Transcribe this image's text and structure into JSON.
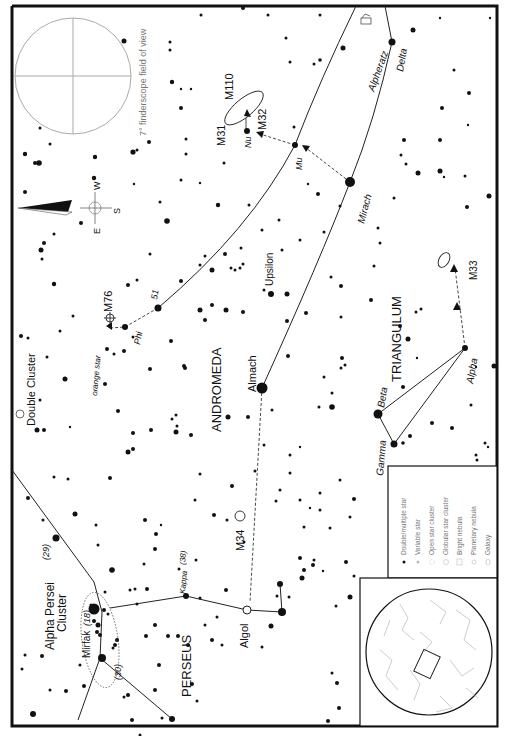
{
  "chart": {
    "orientation": "rotated 90 degrees (text reads bottom-to-top)",
    "finderscope_caption": "7° finderscope field of view",
    "compass": {
      "east": "E",
      "west": "W",
      "south": "S"
    },
    "constellations": [
      "ANDROMEDA",
      "PERSEUS",
      "TRIANGULUM"
    ],
    "objects": {
      "m31": "M31",
      "m32": "M32",
      "m110": "M110",
      "m33": "M33",
      "m34": "M34",
      "m76": "M76",
      "double_cluster": "Double Cluster",
      "alpha_persei_cluster_1": "Alpha Persei",
      "alpha_persei_cluster_2": "Cluster"
    },
    "stars": {
      "alpheratz": "Alpheratz",
      "delta": "Delta",
      "mirach": "Mirach",
      "mu": "Mu",
      "nu": "Nu",
      "upsilon": "Upsilon",
      "almach": "Almach",
      "phi": "Phi",
      "n51": "51",
      "orange_star": "orange star",
      "beta": "Beta",
      "gamma": "Gamma",
      "alpha": "Alpha",
      "algol": "Algol",
      "kappa": "Kappa",
      "kappa_num": "(38)",
      "mirfak": "Mirfak",
      "mirfak_num": "(18)",
      "n29": "(29)",
      "n30": "(30)"
    },
    "legend": {
      "items": [
        {
          "symbol": "dot",
          "label": "Double/multiple star"
        },
        {
          "symbol": "variable",
          "label": "Variable star"
        },
        {
          "symbol": "open-cluster",
          "label": "Open star cluster"
        },
        {
          "symbol": "globular-cluster",
          "label": "Globular star cluster"
        },
        {
          "symbol": "bright-nebula",
          "label": "Bright nebula"
        },
        {
          "symbol": "planetary-nebula",
          "label": "Planetary nebula"
        },
        {
          "symbol": "galaxy",
          "label": "Galaxy"
        }
      ]
    },
    "colors": {
      "ink": "#111111",
      "faint": "#999999",
      "paper": "#ffffff"
    }
  }
}
